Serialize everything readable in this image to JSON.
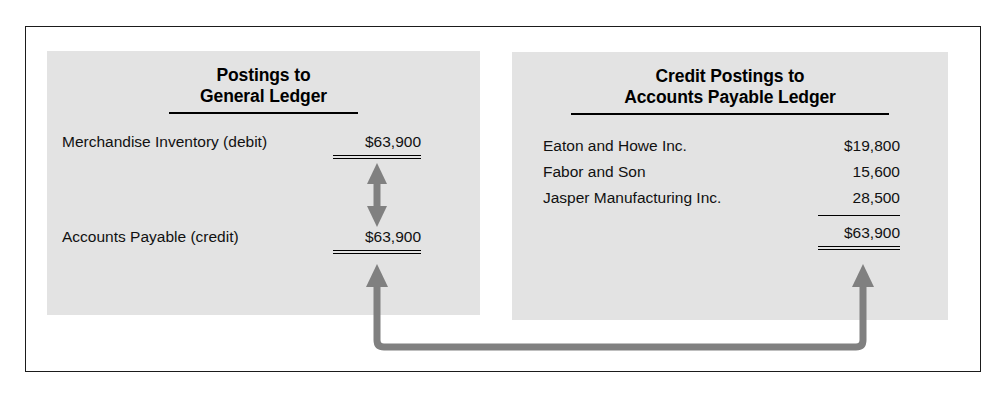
{
  "figure": {
    "left_panel": {
      "title_line1": "Postings to",
      "title_line2": "General Ledger",
      "rows": [
        {
          "label": "Merchandise Inventory (debit)",
          "amount": "$63,900"
        },
        {
          "label": "Accounts Payable (credit)",
          "amount": "$63,900"
        }
      ]
    },
    "right_panel": {
      "title_line1": "Credit Postings to",
      "title_line2": "Accounts Payable Ledger",
      "rows": [
        {
          "label": "Eaton and Howe Inc.",
          "amount": "$19,800"
        },
        {
          "label": "Fabor and Son",
          "amount": "15,600"
        },
        {
          "label": "Jasper Manufacturing Inc.",
          "amount": "28,500"
        }
      ],
      "total": "$63,900"
    },
    "colors": {
      "panel_fill": "#e3e3e3",
      "panel_shadow": "#cfcfcf",
      "frame": "#1b1b1b",
      "arrow": "#808080",
      "text": "#111111"
    },
    "connectors": {
      "vertical_double_arrow": "double-headed-arrow",
      "u_connector": "u-shaped-double-headed-arrow"
    }
  }
}
